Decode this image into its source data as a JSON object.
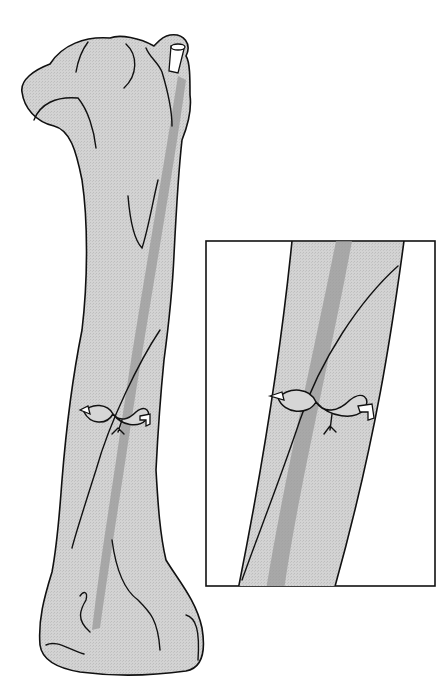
{
  "figure": {
    "panels": [
      {
        "id": "main",
        "description": "Whole bone with oblique fracture line and twisted cerclage wire loop"
      },
      {
        "id": "inset",
        "description": "Magnified view of fracture site and figure-eight wire"
      }
    ],
    "colors": {
      "bone_fill": "#cfcfcf",
      "medullary_canal": "#9a9a9a",
      "outline": "#111111",
      "background": "#ffffff"
    }
  }
}
